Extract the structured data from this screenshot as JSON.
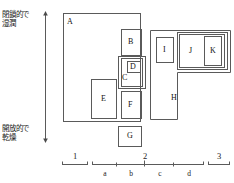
{
  "figure": {
    "vertical_axis": {
      "top_label": "閉鎖的で\n湿潤",
      "top_label_line1": "閉鎖的で",
      "top_label_line2": "湿潤",
      "bottom_label_line1": "開放的で",
      "bottom_label_line2": "乾燥",
      "arrow_style": "double-headed-vertical"
    },
    "regions": [
      {
        "id": "A",
        "label": "A",
        "x": 63,
        "y": 13,
        "w": 78,
        "h": 109,
        "label_x": 67,
        "label_y": 18
      },
      {
        "id": "B",
        "label": "B",
        "x": 121,
        "y": 29,
        "w": 21,
        "h": 27,
        "label_x": 128,
        "label_y": 38
      },
      {
        "id": "C",
        "label": "C",
        "x": 118,
        "y": 56,
        "w": 28,
        "h": 33,
        "label_x": 122,
        "label_y": 74
      },
      {
        "id": "C-inner",
        "label": "",
        "x": 121,
        "y": 58,
        "w": 22,
        "h": 29,
        "label_x": 0,
        "label_y": 0
      },
      {
        "id": "D",
        "label": "D",
        "x": 127,
        "y": 61,
        "w": 14,
        "h": 12,
        "label_x": 130,
        "label_y": 63
      },
      {
        "id": "E",
        "label": "E",
        "x": 91,
        "y": 79,
        "w": 26,
        "h": 40,
        "label_x": 101,
        "label_y": 96
      },
      {
        "id": "F",
        "label": "F",
        "x": 121,
        "y": 91,
        "w": 21,
        "h": 28,
        "label_x": 128,
        "label_y": 101
      },
      {
        "id": "G",
        "label": "G",
        "x": 118,
        "y": 126,
        "w": 24,
        "h": 21,
        "label_x": 127,
        "label_y": 133
      },
      {
        "id": "H",
        "label": "H",
        "x": 150,
        "y": 30,
        "w": 80,
        "h": 90,
        "label_x": 172,
        "label_y": 95
      },
      {
        "id": "I",
        "label": "I",
        "x": 156,
        "y": 37,
        "w": 18,
        "h": 26,
        "label_x": 162,
        "label_y": 46
      },
      {
        "id": "J-outer",
        "label": "",
        "x": 177,
        "y": 32,
        "w": 53,
        "h": 38,
        "label_x": 0,
        "label_y": 0
      },
      {
        "id": "J",
        "label": "J",
        "x": 179,
        "y": 34,
        "w": 48,
        "h": 34,
        "label_x": 189,
        "label_y": 47
      },
      {
        "id": "K",
        "label": "K",
        "x": 204,
        "y": 36,
        "w": 18,
        "h": 30,
        "label_x": 210,
        "label_y": 47
      }
    ],
    "horizontal_scale": {
      "major_labels": [
        {
          "text": "1",
          "x": 73,
          "y": 153
        },
        {
          "text": "2",
          "x": 141,
          "y": 153
        },
        {
          "text": "3",
          "x": 216,
          "y": 153
        }
      ],
      "minor_labels": [
        {
          "text": "a",
          "x": 101,
          "y": 171
        },
        {
          "text": "b",
          "x": 129,
          "y": 171
        },
        {
          "text": "c",
          "x": 160,
          "y": 171
        },
        {
          "text": "d",
          "x": 188,
          "y": 171
        }
      ],
      "segments": [
        {
          "name": "segment-1",
          "x1": 62,
          "x2": 88,
          "y": 164
        },
        {
          "name": "segment-2",
          "x1": 92,
          "x2": 204,
          "y": 164
        },
        {
          "name": "segment-3",
          "x1": 208,
          "x2": 230,
          "y": 164
        }
      ],
      "inner_ticks": [
        116,
        144,
        173
      ]
    },
    "colors": {
      "line": "#5a5a5a",
      "text": "#1a1a1a",
      "background": "#ffffff"
    }
  }
}
